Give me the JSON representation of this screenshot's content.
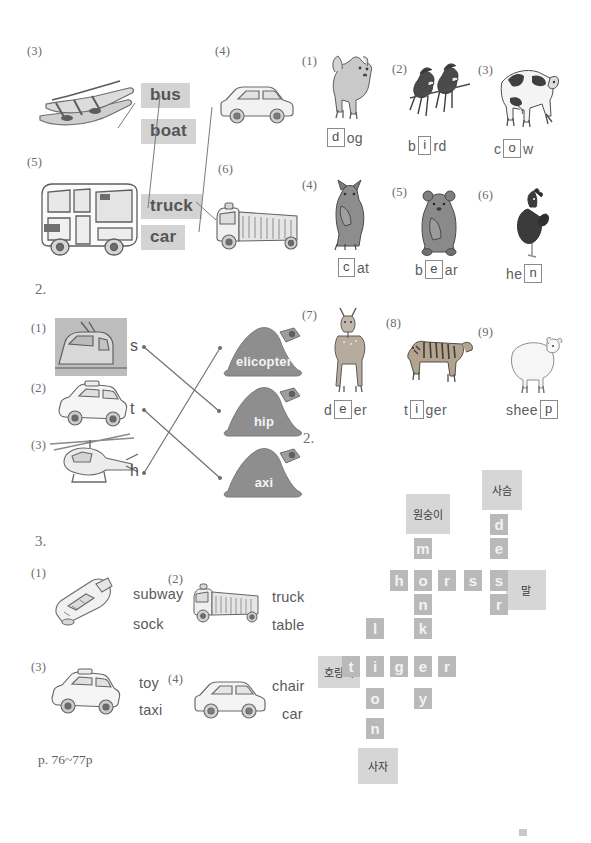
{
  "worksheet": {
    "footer": "p. 76~77p",
    "section_numbers": {
      "two_left": "2.",
      "three_left": "3.",
      "two_right": "2."
    }
  },
  "match_vehicles": {
    "items": [
      {
        "num": "(3)",
        "picture": "kayak-boat-illustration"
      },
      {
        "num": "(4)",
        "picture": "white-car-illustration"
      },
      {
        "num": "(5)",
        "picture": "bus-illustration"
      },
      {
        "num": "(6)",
        "picture": "truck-illustration"
      }
    ],
    "word_chips": [
      "bus",
      "boat",
      "truck",
      "car"
    ],
    "connections": [
      {
        "from": "boat-picture",
        "to": "boat"
      },
      {
        "from": "bus-picture",
        "to": "bus"
      },
      {
        "from": "car-picture",
        "to": "car"
      },
      {
        "from": "truck-picture",
        "to": "truck"
      }
    ]
  },
  "animal_words": {
    "items": [
      {
        "num": "(1)",
        "picture": "dog-illustration",
        "prefix": "",
        "boxed": "d",
        "suffix": "og",
        "word": "dog"
      },
      {
        "num": "(2)",
        "picture": "birds-illustration",
        "prefix": "b",
        "boxed": "i",
        "suffix": "rd",
        "word": "bird"
      },
      {
        "num": "(3)",
        "picture": "cow-illustration",
        "prefix": "c",
        "boxed": "o",
        "suffix": "w",
        "word": "cow"
      },
      {
        "num": "(4)",
        "picture": "cat-illustration",
        "prefix": "",
        "boxed": "c",
        "suffix": "at",
        "word": "cat"
      },
      {
        "num": "(5)",
        "picture": "bear-illustration",
        "prefix": "b",
        "boxed": "e",
        "suffix": "ar",
        "word": "bear"
      },
      {
        "num": "(6)",
        "picture": "hen-illustration",
        "prefix": "he",
        "boxed": "n",
        "suffix": "",
        "word": "hen"
      },
      {
        "num": "(7)",
        "picture": "deer-illustration",
        "prefix": "d",
        "boxed": "e",
        "suffix": "er",
        "word": "deer"
      },
      {
        "num": "(8)",
        "picture": "tiger-illustration",
        "prefix": "t",
        "boxed": "i",
        "suffix": "ger",
        "word": "tiger"
      },
      {
        "num": "(9)",
        "picture": "sheep-illustration",
        "prefix": "shee",
        "boxed": "p",
        "suffix": "",
        "word": "sheep"
      }
    ]
  },
  "match_letters": {
    "items": [
      {
        "num": "(1)",
        "picture": "subway-train-photo",
        "letter": "s"
      },
      {
        "num": "(2)",
        "picture": "taxi-illustration",
        "letter": "t"
      },
      {
        "num": "(3)",
        "picture": "helicopter-illustration",
        "letter": "h"
      }
    ],
    "hats": [
      {
        "text": "elicopter"
      },
      {
        "text": "hip"
      },
      {
        "text": "axi"
      }
    ],
    "connections": [
      {
        "from": "s",
        "to": "hip"
      },
      {
        "from": "t",
        "to": "axi"
      },
      {
        "from": "h",
        "to": "elicopter"
      }
    ]
  },
  "choose_word": {
    "items": [
      {
        "num": "(1)",
        "picture": "subway-illustration",
        "options": [
          "subway",
          "sock"
        ]
      },
      {
        "num": "(2)",
        "picture": "fire-truck-illustration",
        "options": [
          "truck",
          "table"
        ]
      },
      {
        "num": "(3)",
        "picture": "taxi-illustration",
        "options": [
          "toy",
          "taxi"
        ]
      },
      {
        "num": "(4)",
        "picture": "car-illustration",
        "options": [
          "chair",
          "car"
        ]
      }
    ]
  },
  "crossword": {
    "cells": [
      {
        "ch": "m",
        "col": 2,
        "row": 1
      },
      {
        "ch": "h",
        "col": 1,
        "row": 2
      },
      {
        "ch": "o",
        "col": 2,
        "row": 2
      },
      {
        "ch": "r",
        "col": 3,
        "row": 2
      },
      {
        "ch": "s",
        "col": 4,
        "row": 2
      },
      {
        "ch": "e",
        "col": 5,
        "row": 2
      },
      {
        "ch": "n",
        "col": 2,
        "row": 3
      },
      {
        "ch": "k",
        "col": 2,
        "row": 4
      },
      {
        "ch": "l",
        "col": 1,
        "row": 4
      },
      {
        "ch": "t",
        "col": 0,
        "row": 5
      },
      {
        "ch": "i",
        "col": 1,
        "row": 5
      },
      {
        "ch": "g",
        "col": 2,
        "row": 5
      },
      {
        "ch": "e",
        "col": 3,
        "row": 5
      },
      {
        "ch": "r",
        "col": 4,
        "row": 5
      },
      {
        "ch": "o",
        "col": 1,
        "row": 6
      },
      {
        "ch": "y",
        "col": 2,
        "row": 6
      },
      {
        "ch": "n",
        "col": 1,
        "row": 7
      },
      {
        "ch": "d",
        "col": 5,
        "row": 0
      },
      {
        "ch": "e",
        "col": 5,
        "row": 1
      },
      {
        "ch": "e",
        "col": 5,
        "row": 3
      },
      {
        "ch": "r",
        "col": 5,
        "row": 3
      }
    ],
    "words": [
      {
        "word": "monkey",
        "korean": "원숭이",
        "direction": "down"
      },
      {
        "word": "horse",
        "korean": "말",
        "direction": "across"
      },
      {
        "word": "deer",
        "korean": "사슴",
        "direction": "down"
      },
      {
        "word": "tiger",
        "korean": "호랑이",
        "direction": "across"
      },
      {
        "word": "lion",
        "korean": "사자",
        "direction": "down"
      }
    ],
    "clues": [
      {
        "label": "사슴",
        "meaning": "deer"
      },
      {
        "label": "원숭이",
        "meaning": "monkey"
      },
      {
        "label": "말",
        "meaning": "horse"
      },
      {
        "label": "호랑이",
        "meaning": "tiger"
      },
      {
        "label": "사자",
        "meaning": "lion"
      }
    ]
  },
  "colors": {
    "chip_bg": "#d3d3d3",
    "cell_bg": "#b9b9b9",
    "cell_text": "#f2f2f2",
    "clue_bg": "#d6d6d6",
    "hat_fill": "#8e8e8e",
    "text": "#5a5a5a"
  }
}
